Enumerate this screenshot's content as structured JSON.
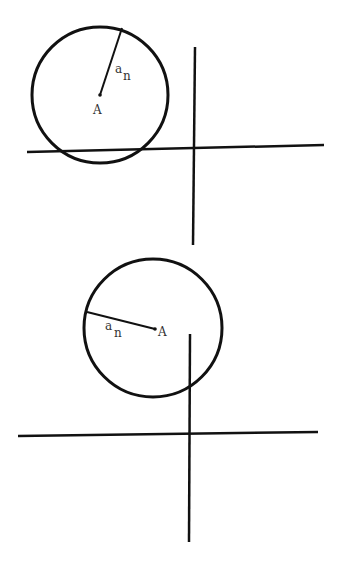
{
  "diagrams": [
    {
      "id": "top",
      "circle": {
        "cx": 100,
        "cy": 95,
        "r": 68
      },
      "radius_line": {
        "x1": 100,
        "y1": 95,
        "x2": 122,
        "y2": 28
      },
      "center_label": "A",
      "radius_label_main": "a",
      "radius_label_sub": "n",
      "h_axis": {
        "x1": 27,
        "y1": 152,
        "x2": 324,
        "y2": 145
      },
      "v_axis": {
        "x1": 195,
        "y1": 47,
        "x2": 193,
        "y2": 245
      }
    },
    {
      "id": "bottom",
      "circle": {
        "cx": 153,
        "cy": 328,
        "r": 69
      },
      "radius_line": {
        "x1": 87,
        "y1": 312,
        "x2": 155,
        "y2": 329
      },
      "center_label": "A",
      "radius_label_main": "a",
      "radius_label_sub": "n",
      "h_axis": {
        "x1": 18,
        "y1": 436,
        "x2": 318,
        "y2": 432
      },
      "v_axis": {
        "x1": 190,
        "y1": 334,
        "x2": 189,
        "y2": 542
      }
    }
  ],
  "colors": {
    "stroke": "#111111",
    "label": "#333333",
    "background": "#ffffff"
  }
}
